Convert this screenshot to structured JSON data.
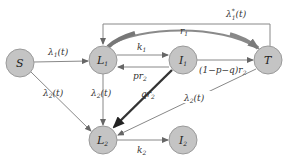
{
  "diagram": {
    "type": "compartmental-flow-diagram",
    "nodes": [
      {
        "id": "S",
        "label": "S",
        "sub": "",
        "cx": 20,
        "cy": 63
      },
      {
        "id": "L1",
        "label": "L",
        "sub": "1",
        "cx": 103,
        "cy": 60
      },
      {
        "id": "I1",
        "label": "I",
        "sub": "1",
        "cx": 183,
        "cy": 60
      },
      {
        "id": "T",
        "label": "T",
        "sub": "",
        "cx": 268,
        "cy": 60
      },
      {
        "id": "L2",
        "label": "L",
        "sub": "2",
        "cx": 103,
        "cy": 140
      },
      {
        "id": "I2",
        "label": "I",
        "sub": "2",
        "cx": 183,
        "cy": 140
      }
    ],
    "edges": [
      {
        "from": "S",
        "to": "L1",
        "label": "λ₁(t)",
        "style": "thin"
      },
      {
        "from": "L1",
        "to": "I1",
        "label": "k₁",
        "style": "thin"
      },
      {
        "from": "I1",
        "to": "L1",
        "label": "pr₂",
        "style": "thin"
      },
      {
        "from": "I1",
        "to": "T",
        "label": "(1−p−q)r₂",
        "style": "thin"
      },
      {
        "from": "L1",
        "to": "T",
        "label": "r₁",
        "style": "thick-curved"
      },
      {
        "from": "T",
        "to": "L1",
        "label": "λ₁*(t)",
        "style": "thin-loop"
      },
      {
        "from": "S",
        "to": "L2",
        "label": "λ₂(t)",
        "style": "thin"
      },
      {
        "from": "L1",
        "to": "L2",
        "label": "λ₂(t)",
        "style": "thin"
      },
      {
        "from": "I1",
        "to": "L2",
        "label": "qr₂",
        "style": "thick"
      },
      {
        "from": "T",
        "to": "L2",
        "label": "λ₂(t)",
        "style": "thin"
      },
      {
        "from": "L2",
        "to": "I2",
        "label": "k₂",
        "style": "thin"
      }
    ],
    "labels": {
      "S": "S",
      "L1": "L",
      "L1_sub": "1",
      "I1": "I",
      "I1_sub": "1",
      "T": "T",
      "L2": "L",
      "L2_sub": "2",
      "I2": "I",
      "I2_sub": "2",
      "lambda1_base": "λ",
      "lambda1_sub": "1",
      "lambda1_arg": "(t)",
      "lambda1star_base": "λ",
      "lambda1star_sup": "*",
      "lambda1star_sub": "1",
      "lambda1star_arg": "(t)",
      "lambda2_base": "λ",
      "lambda2_sub": "2",
      "lambda2_arg": "(t)",
      "k1_base": "k",
      "k1_sub": "1",
      "k2_base": "k",
      "k2_sub": "2",
      "r1_base": "r",
      "r1_sub": "1",
      "pr2_base": "pr",
      "pr2_sub": "2",
      "qr2_base": "qr",
      "qr2_sub": "2",
      "toT_base": "(1−p−q)r",
      "toT_sub": "2"
    },
    "colors": {
      "node_fill": "#c4c4c4",
      "node_stroke": "#9a9a9a",
      "edge_thin": "#888888",
      "edge_thick": "#333333",
      "curved_thick": "#777777",
      "background": "#ffffff"
    }
  }
}
